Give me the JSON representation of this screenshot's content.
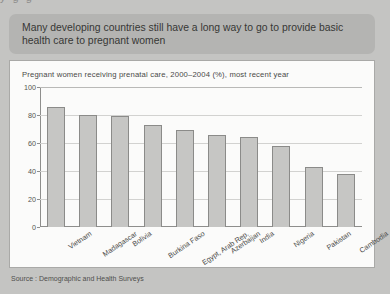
{
  "header": {
    "banner_text": "Many developing countries still have a long way to go to provide basic health care to pregnant women"
  },
  "top_bleed": {
    "artifact_text": "y g g"
  },
  "source": {
    "text": "Source : Demographic and Health Surveys"
  },
  "chart_data": {
    "type": "bar",
    "title": "Pregnant women receiving prenatal care, 2000–2004 (%), most recent year",
    "xlabel": "",
    "ylabel": "",
    "ylim": [
      0,
      100
    ],
    "yticks": [
      0,
      20,
      40,
      60,
      80,
      100
    ],
    "ytick_labels": [
      "0",
      "20",
      "40",
      "60",
      "80",
      "100"
    ],
    "grid": true,
    "legend": "none",
    "bar_color": "#c6c6c4",
    "bar_border_color": "#8b8b89",
    "categories": [
      "Vietnam",
      "Madagascar",
      "Bolivia",
      "Burkina Faso",
      "Egypt, Arab Rep.",
      "Azerbaijan",
      "India",
      "Nigeria",
      "Pakistan",
      "Cambodia"
    ],
    "values": [
      86,
      80,
      79,
      73,
      69,
      66,
      64,
      58,
      43,
      38
    ]
  }
}
